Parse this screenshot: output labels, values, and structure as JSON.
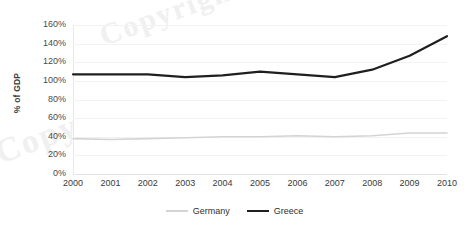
{
  "chart_data": {
    "type": "line",
    "title": "",
    "xlabel": "",
    "ylabel": "% of GDP",
    "categories": [
      "2000",
      "2001",
      "2002",
      "2003",
      "2004",
      "2005",
      "2006",
      "2007",
      "2008",
      "2009",
      "2010"
    ],
    "ylim": [
      0,
      160
    ],
    "ytick_step": 20,
    "ytick_labels": [
      "160%",
      "140%",
      "120%",
      "100%",
      "80%",
      "60%",
      "40%",
      "20%",
      "0%"
    ],
    "ytick_values": [
      160,
      140,
      120,
      100,
      80,
      60,
      40,
      20,
      0
    ],
    "grid": "horizontal",
    "legend_position": "bottom-center",
    "series": [
      {
        "name": "Germany",
        "color": "#d4d4d4",
        "line_width": 1.6,
        "values": [
          38,
          37,
          38,
          39,
          40,
          40,
          41,
          40,
          41,
          44,
          44
        ]
      },
      {
        "name": "Greece",
        "color": "#1f1f1f",
        "line_width": 2.2,
        "values": [
          107,
          107,
          107,
          104,
          106,
          110,
          107,
          104,
          112,
          127,
          148
        ]
      }
    ]
  },
  "legend": {
    "items": [
      {
        "label": "Germany"
      },
      {
        "label": "Greece"
      }
    ]
  },
  "watermark": {
    "top_text": "Copyright",
    "left_text": "Copy"
  }
}
